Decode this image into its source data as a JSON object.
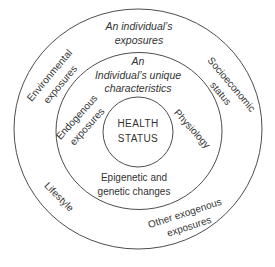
{
  "figure": {
    "type": "concentric-rings-diagram",
    "colors": {
      "background": "#ffffff",
      "ring_stroke": "#4d4d4d",
      "text": "#333333"
    },
    "center": {
      "label": "HEALTH\nSTATUS"
    },
    "middle_ring": {
      "top": "An\nIndividual’s unique\ncharacteristics",
      "left": "Endogenous\nexposures",
      "right": "Physiology",
      "bottom": "Epigenetic and\ngenetic changes"
    },
    "outer_ring": {
      "top": "An individual’s\nexposures",
      "upper_left": "Environmental\nexposures",
      "upper_right": "Socioeconomic\nstatus",
      "lower_left": "Lifestyle",
      "lower_right": "Other exogenous\nexposures"
    }
  }
}
